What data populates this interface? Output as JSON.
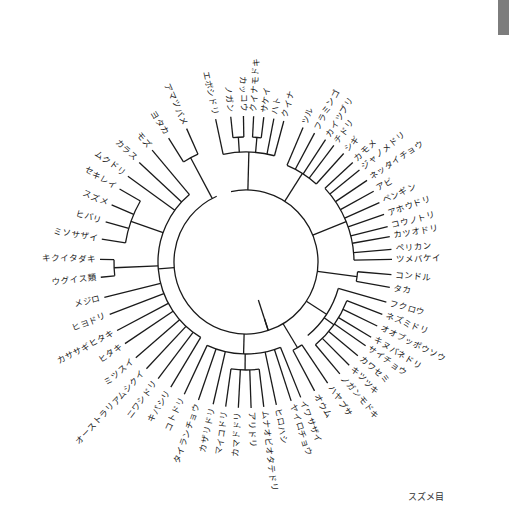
{
  "page": {
    "top_caption": "",
    "legend_label": "スズメ目"
  },
  "tree": {
    "center": [
      246,
      262
    ],
    "leaf_radius": 150,
    "root_angle_deg": 208,
    "line_color": "#1a1a1a",
    "leaves": [
      {
        "label": "エボシドリ",
        "angle": -102
      },
      {
        "label": "ノガン",
        "angle": -96
      },
      {
        "label": "カッコウ",
        "angle": -91
      },
      {
        "label": "クイナモドキ",
        "angle": -87
      },
      {
        "label": "サケイ",
        "angle": -83
      },
      {
        "label": "ハト",
        "angle": -79
      },
      {
        "label": "クイナ",
        "angle": -75
      },
      {
        "label": "ツル",
        "angle": -67
      },
      {
        "label": "フラミンゴ",
        "angle": -62
      },
      {
        "label": "カイツブリ",
        "angle": -57
      },
      {
        "label": "チドリ",
        "angle": -53
      },
      {
        "label": "シギ",
        "angle": -48
      },
      {
        "label": "カモメ",
        "angle": -43
      },
      {
        "label": "ジャノメドリ",
        "angle": -39
      },
      {
        "label": "ネッタイチョウ",
        "angle": -34
      },
      {
        "label": "アビ",
        "angle": -29
      },
      {
        "label": "ペンギン",
        "angle": -24
      },
      {
        "label": "アホウドリ",
        "angle": -19
      },
      {
        "label": "コウノトリ",
        "angle": -14
      },
      {
        "label": "カツオドリ",
        "angle": -10
      },
      {
        "label": "ペリカン",
        "angle": -5
      },
      {
        "label": "ツメバケイ",
        "angle": -1
      },
      {
        "label": "コンドル",
        "angle": 5
      },
      {
        "label": "タカ",
        "angle": 10
      },
      {
        "label": "フクロウ",
        "angle": 16
      },
      {
        "label": "ネズミドリ",
        "angle": 21
      },
      {
        "label": "オオブッポウソウ",
        "angle": 26
      },
      {
        "label": "キヌバネドリ",
        "angle": 31
      },
      {
        "label": "サイチョウ",
        "angle": 35
      },
      {
        "label": "カワセミ",
        "angle": 40
      },
      {
        "label": "キツツキ",
        "angle": 45
      },
      {
        "label": "ノガンモドキ",
        "angle": 50
      },
      {
        "label": "ハヤブサ",
        "angle": 56
      },
      {
        "label": "オウム",
        "angle": 62
      },
      {
        "label": "イワサザイ",
        "angle": 68
      },
      {
        "label": "ヤイロチョウ",
        "angle": 72
      },
      {
        "label": "ヒロハシ",
        "angle": 78
      },
      {
        "label": "ムナオビオタテドリ",
        "angle": 83
      },
      {
        "label": "アリドリ",
        "angle": 88
      },
      {
        "label": "カマドドリ",
        "angle": 93
      },
      {
        "label": "マイコドリ",
        "angle": 98
      },
      {
        "label": "カザリドリ",
        "angle": 103
      },
      {
        "label": "タイランチョウ",
        "angle": 109
      },
      {
        "label": "コトドリ",
        "angle": 115
      },
      {
        "label": "キバシリ",
        "angle": 121
      },
      {
        "label": "ニワシドリ",
        "angle": 127
      },
      {
        "label": "オーストラリアムシクイ",
        "angle": 133
      },
      {
        "label": "ミツスイ",
        "angle": 139
      },
      {
        "label": "ヒタキ",
        "angle": 146
      },
      {
        "label": "カササギヒタキ",
        "angle": 152
      },
      {
        "label": "ヒヨドリ",
        "angle": 159
      },
      {
        "label": "メジロ",
        "angle": 166
      },
      {
        "label": "ウグイス類",
        "angle": 174
      },
      {
        "label": "キクイタダキ",
        "angle": 181
      },
      {
        "label": "ミソサザイ",
        "angle": 189
      },
      {
        "label": "ヒバリ",
        "angle": 196
      },
      {
        "label": "スズメ",
        "angle": 203
      },
      {
        "label": "セキレイ",
        "angle": 210
      },
      {
        "label": "ムクドリ",
        "angle": 216
      },
      {
        "label": "カラス",
        "angle": 223
      },
      {
        "label": "モズ",
        "angle": 230
      },
      {
        "label": "ヨタカ",
        "angle": 238
      },
      {
        "label": "アマツバメ",
        "angle": 246
      }
    ],
    "clades": [
      {
        "members": [
          0,
          6
        ],
        "r": 110
      },
      {
        "members": [
          1,
          2
        ],
        "r": 125
      },
      {
        "members": [
          3,
          4
        ],
        "r": 125
      },
      {
        "members": [
          7,
          11
        ],
        "r": 105
      },
      {
        "members": [
          12,
          21
        ],
        "r": 108
      },
      {
        "members": [
          22,
          23
        ],
        "r": 112
      },
      {
        "members": [
          24,
          31
        ],
        "r": 96
      },
      {
        "members": [
          25,
          31
        ],
        "r": 108
      },
      {
        "members": [
          32,
          33
        ],
        "r": 100
      },
      {
        "members": [
          34,
          43
        ],
        "r": 92
      },
      {
        "members": [
          37,
          40
        ],
        "r": 108
      },
      {
        "members": [
          44,
          60
        ],
        "r": 88
      },
      {
        "members": [
          52,
          53
        ],
        "r": 132
      },
      {
        "members": [
          54,
          57
        ],
        "r": 122
      },
      {
        "members": [
          61,
          62
        ],
        "r": 118
      },
      {
        "members": [
          0,
          62
        ],
        "r": 72
      }
    ]
  }
}
